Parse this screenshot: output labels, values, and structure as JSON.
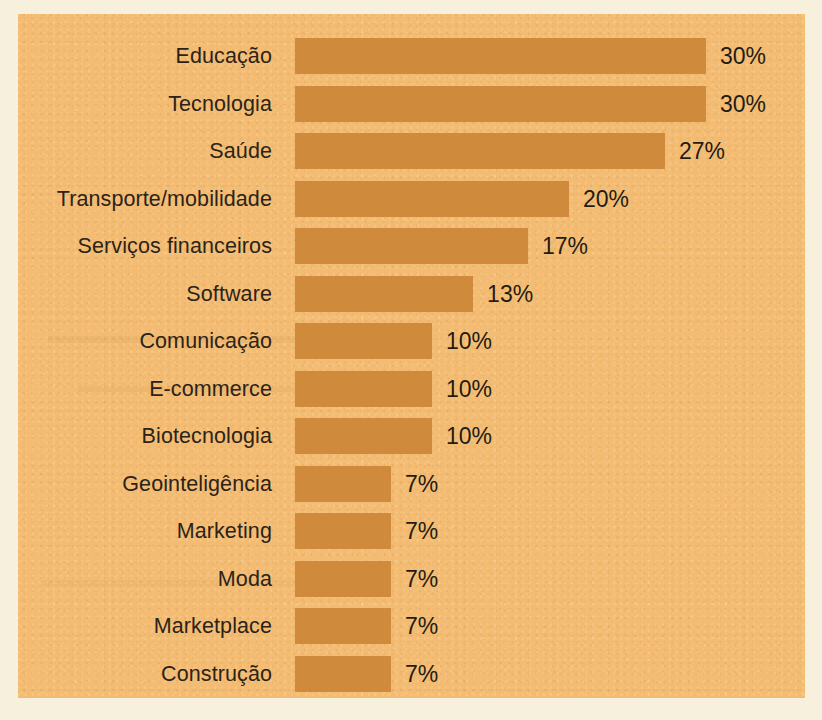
{
  "chart_data": {
    "type": "bar",
    "orientation": "horizontal",
    "title": "",
    "subtitle": "",
    "xlabel": "",
    "ylabel": "",
    "grid": false,
    "legend": null,
    "axis_visible": false,
    "xlim": [
      0,
      30
    ],
    "value_suffix": "%",
    "categories": [
      "Educação",
      "Tecnologia",
      "Saúde",
      "Transporte/mobilidade",
      "Serviços financeiros",
      "Software",
      "Comunicação",
      "E-commerce",
      "Biotecnologia",
      "Geointeligência",
      "Marketing",
      "Moda",
      "Marketplace",
      "Construção"
    ],
    "values": [
      30,
      30,
      27,
      20,
      17,
      13,
      10,
      10,
      10,
      7,
      7,
      7,
      7,
      7
    ],
    "value_labels": [
      "30%",
      "30%",
      "27%",
      "20%",
      "17%",
      "13%",
      "10%",
      "10%",
      "10%",
      "7%",
      "7%",
      "7%",
      "7%",
      "7%"
    ]
  },
  "colors": {
    "page_background": "#f6f0dc",
    "panel_background": "#f4bc72",
    "bar_fill": "#d08a3c",
    "label_text": "#2c2318",
    "value_text": "#241c12"
  }
}
